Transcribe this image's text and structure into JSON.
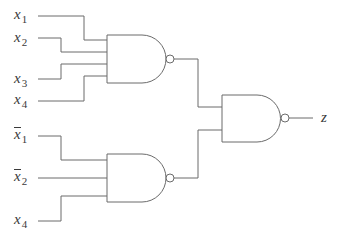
{
  "diagram": {
    "type": "logic-circuit",
    "gate_type": "NAND",
    "colors": {
      "wire": "#6b6b6b",
      "label": "#3a3a3a",
      "background": "#ffffff"
    },
    "inputs_gate1": [
      {
        "var": "x",
        "sub": "1",
        "negated": false
      },
      {
        "var": "x",
        "sub": "2",
        "negated": false
      },
      {
        "var": "x",
        "sub": "3",
        "negated": false
      },
      {
        "var": "x",
        "sub": "4",
        "negated": false
      }
    ],
    "inputs_gate2": [
      {
        "var": "x",
        "sub": "1",
        "negated": true
      },
      {
        "var": "x",
        "sub": "2",
        "negated": true
      },
      {
        "var": "x",
        "sub": "4",
        "negated": false
      }
    ],
    "gates": [
      {
        "id": "G1",
        "type": "NAND",
        "inputs": 4
      },
      {
        "id": "G2",
        "type": "NAND",
        "inputs": 3
      },
      {
        "id": "G3",
        "type": "NAND",
        "inputs": 2
      }
    ],
    "output": {
      "label": "z"
    }
  }
}
